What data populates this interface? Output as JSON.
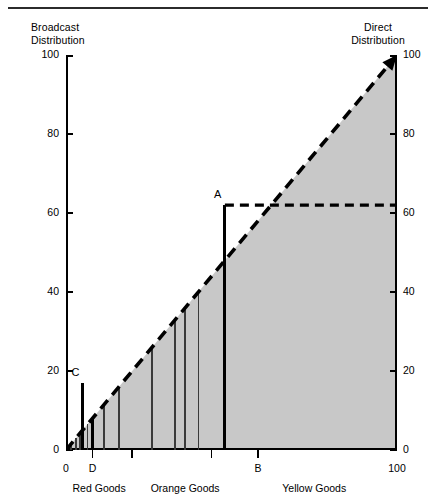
{
  "meta": {
    "background_color": "#ffffff",
    "fill_color": "#c8c8c8",
    "line_color": "#000000"
  },
  "captions": {
    "top_left": "Broadcast\nDistribution",
    "top_right": "Direct\nDistribution"
  },
  "axes": {
    "y_left_ticks": [
      "0",
      "20",
      "40",
      "60",
      "80",
      "100"
    ],
    "y_right_ticks": [
      "0",
      "20",
      "40",
      "60",
      "80",
      "100"
    ],
    "x_ticks": [
      "0",
      "D",
      "B",
      "100"
    ],
    "x_tick_values": [
      0,
      8,
      58,
      100
    ]
  },
  "sections": [
    {
      "label": "Red Goods",
      "center": 10
    },
    {
      "label": "Orange Goods",
      "center": 36
    },
    {
      "label": "Yellow Goods",
      "center": 75
    }
  ],
  "points": [
    {
      "label": "A",
      "x": 48.0,
      "y": 62.0
    },
    {
      "label": "C",
      "x": 5.0,
      "y": 17.0
    }
  ],
  "chart_data": {
    "type": "line",
    "title": "",
    "subtitle": "",
    "xlabel": "",
    "ylabel": "",
    "xlim": [
      0,
      100
    ],
    "ylim": [
      0,
      100
    ],
    "grid": false,
    "legend": "none",
    "annotations": [
      "Broadcast Distribution",
      "Direct Distribution",
      "Red Goods",
      "Orange Goods",
      "Yellow Goods",
      "A",
      "B",
      "C",
      "D"
    ],
    "series": [
      {
        "name": "45-degree reference line (dashed)",
        "style": "dashed",
        "x": [
          0,
          100
        ],
        "values": [
          0,
          100
        ]
      },
      {
        "name": "Guide line from A to right axis (dashed horizontal)",
        "style": "dashed",
        "x": [
          48,
          100
        ],
        "values": [
          62,
          62
        ]
      }
    ],
    "bars": {
      "description": "Vertical drop lines from the 45-degree diagonal to the x-axis at selected cumulative positions",
      "x": [
        1.5,
        3.0,
        4.3,
        5.0,
        6.5,
        8.0,
        11.5,
        16.0,
        26.0,
        33.0,
        36.0,
        40.0,
        48.0
      ],
      "values": [
        1.5,
        3.0,
        4.3,
        17.0,
        6.5,
        8.0,
        11.5,
        16.0,
        26.0,
        33.0,
        36.0,
        40.0,
        62.0
      ],
      "weights": [
        "thin",
        "thin",
        "thin",
        "heavy",
        "thin",
        "heavy",
        "thin",
        "thin",
        "thin",
        "thin",
        "thin",
        "thin",
        "heavy"
      ]
    }
  }
}
